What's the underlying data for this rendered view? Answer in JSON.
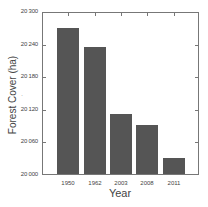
{
  "chart_data": {
    "type": "bar",
    "title": "",
    "xlabel": "Year",
    "ylabel": "Forest Cover (ha)",
    "categories": [
      "1950",
      "1962",
      "2003",
      "2008",
      "2011"
    ],
    "values": [
      20268,
      20233,
      20111,
      20091,
      20030
    ],
    "ylim": [
      20000,
      20300
    ],
    "yticks": [
      20000,
      20060,
      20120,
      20180,
      20240,
      20300
    ],
    "ytick_labels": [
      "20 000",
      "20 060",
      "20 120",
      "20 180",
      "20 240",
      "20 300"
    ],
    "grid": false,
    "legend": null,
    "bar_color": "#555555"
  }
}
